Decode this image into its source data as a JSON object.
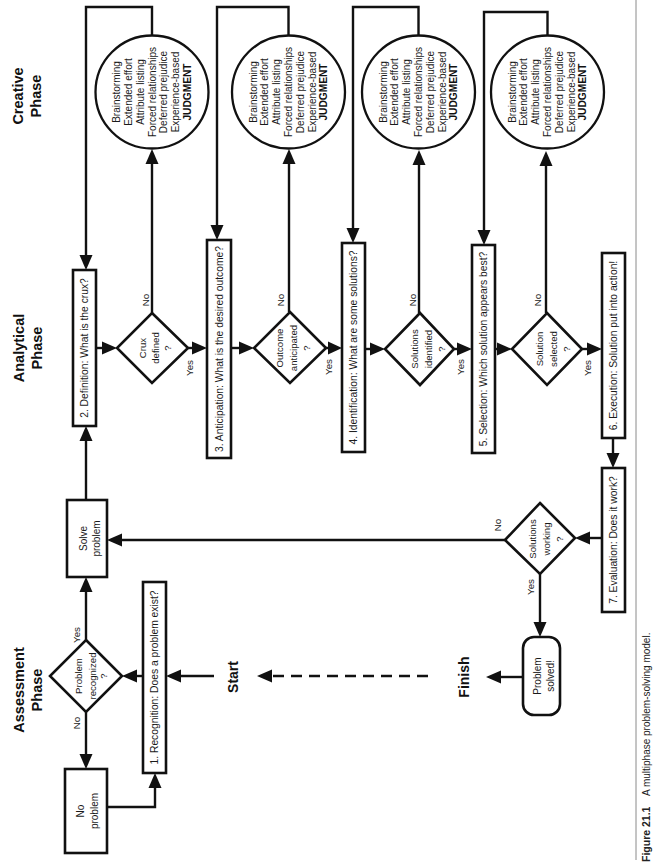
{
  "phases": {
    "creative": [
      "Creative",
      "Phase"
    ],
    "analytical": [
      "Analytical",
      "Phase"
    ],
    "assessment": [
      "Assessment",
      "Phase"
    ]
  },
  "terminals": {
    "start": "Start",
    "finish": "Finish"
  },
  "steps": [
    "1. Recognition: Does a problem exist?",
    "2. Definition: What is the crux?",
    "3. Anticipation: What is the desired outcome?",
    "4. Identification: What are some solutions?",
    "5. Selection: Which solution appears best?",
    "6. Execution: Solution put into action!",
    "7. Evaluation: Does it work?"
  ],
  "decisions": [
    [
      "Problem",
      "recognized",
      "?"
    ],
    [
      "Crux",
      "defined",
      "?"
    ],
    [
      "Outcome",
      "anticipated",
      "?"
    ],
    [
      "Solutions",
      "identified",
      "?"
    ],
    [
      "Solution",
      "selected",
      "?"
    ],
    [
      "Solutions",
      "working",
      "?"
    ]
  ],
  "outcomes": {
    "no_problem": [
      "No",
      "problem"
    ],
    "solve_problem": [
      "Solve",
      "problem"
    ],
    "problem_solved": [
      "Problem",
      "solved!"
    ]
  },
  "branch_labels": {
    "yes": "Yes",
    "no": "No"
  },
  "creative_techniques": [
    "Brainstorming",
    "Extended effort",
    "Attribute listing",
    "Forced relationships",
    "Deferred prejudice",
    "Experience-based",
    "JUDGMENT"
  ],
  "flow": [
    {
      "from": "Start",
      "to": "1. Recognition"
    },
    {
      "from": "1. Recognition",
      "to": "Problem recognized?"
    },
    {
      "from": "Problem recognized?",
      "label": "No",
      "to": "No problem"
    },
    {
      "from": "No problem",
      "to": "1. Recognition"
    },
    {
      "from": "Problem recognized?",
      "label": "Yes",
      "to": "Solve problem"
    },
    {
      "from": "Solve problem",
      "to": "2. Definition"
    },
    {
      "from": "2. Definition",
      "to": "Crux defined?"
    },
    {
      "from": "Crux defined?",
      "label": "No",
      "to": "Creative techniques",
      "then": "2. Definition"
    },
    {
      "from": "Crux defined?",
      "label": "Yes",
      "to": "3. Anticipation"
    },
    {
      "from": "3. Anticipation",
      "to": "Outcome anticipated?"
    },
    {
      "from": "Outcome anticipated?",
      "label": "No",
      "to": "Creative techniques",
      "then": "3. Anticipation"
    },
    {
      "from": "Outcome anticipated?",
      "label": "Yes",
      "to": "4. Identification"
    },
    {
      "from": "4. Identification",
      "to": "Solutions identified?"
    },
    {
      "from": "Solutions identified?",
      "label": "No",
      "to": "Creative techniques",
      "then": "4. Identification"
    },
    {
      "from": "Solutions identified?",
      "label": "Yes",
      "to": "5. Selection"
    },
    {
      "from": "5. Selection",
      "to": "Solution selected?"
    },
    {
      "from": "Solution selected?",
      "label": "No",
      "to": "Creative techniques",
      "then": "5. Selection"
    },
    {
      "from": "Solution selected?",
      "label": "Yes",
      "to": "6. Execution"
    },
    {
      "from": "6. Execution",
      "to": "7. Evaluation"
    },
    {
      "from": "7. Evaluation",
      "to": "Solutions working?"
    },
    {
      "from": "Solutions working?",
      "label": "No",
      "to": "Solve problem"
    },
    {
      "from": "Solutions working?",
      "label": "Yes",
      "to": "Problem solved!"
    },
    {
      "from": "Problem solved!",
      "to": "Finish"
    },
    {
      "from": "Finish",
      "to": "Start",
      "style": "dashed"
    }
  ],
  "caption": {
    "label": "Figure 21.1",
    "text": "A multiphase problem-solving model."
  }
}
